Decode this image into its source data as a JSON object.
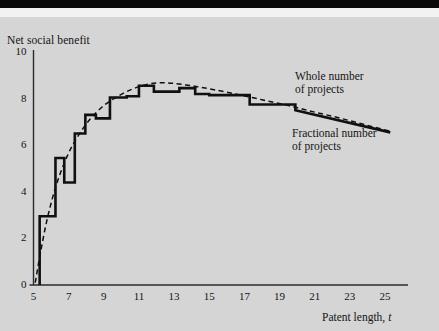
{
  "figure": {
    "background_color": "#d5d5d5",
    "top_bar_color": "#0a0a0a",
    "line_color": "#101010",
    "axis_color": "#2b2b2b"
  },
  "axes": {
    "y_title": "Net social benefit",
    "x_title_prefix": "Patent length, ",
    "x_title_symbol": "t",
    "y_ticks": [
      "0",
      "2",
      "4",
      "6",
      "8",
      "10"
    ],
    "x_ticks": [
      "5",
      "7",
      "9",
      "11",
      "13",
      "15",
      "17",
      "19",
      "21",
      "23",
      "25"
    ]
  },
  "annotations": [
    {
      "name": "whole-number-label",
      "line1": "Whole number",
      "line2": "of projects"
    },
    {
      "name": "fractional-number-label",
      "line1": "Fractional number",
      "line2": "of projects"
    }
  ],
  "chart_data": {
    "type": "line",
    "title": "",
    "xlabel": "Patent length, t",
    "ylabel": "Net social benefit",
    "xlim": [
      5,
      26
    ],
    "ylim": [
      0,
      10
    ],
    "grid": false,
    "legend_position": "inline-annotations",
    "y_ticks": [
      0,
      2,
      4,
      6,
      8,
      10
    ],
    "x_ticks": [
      5,
      7,
      9,
      11,
      13,
      15,
      17,
      19,
      21,
      23,
      25
    ],
    "series": [
      {
        "name": "Whole number of projects",
        "style": "solid-step",
        "x": [
          5.35,
          5.35,
          6.25,
          6.25,
          6.75,
          6.75,
          7.35,
          7.35,
          7.95,
          7.95,
          8.55,
          8.55,
          9.35,
          9.35,
          10.3,
          10.3,
          11.0,
          11.0,
          11.85,
          11.85,
          13.3,
          13.3,
          14.2,
          14.2,
          15.0,
          15.0,
          17.3,
          17.3,
          19.9,
          19.9,
          25.3
        ],
        "y": [
          0.0,
          2.95,
          2.95,
          5.45,
          5.45,
          4.4,
          4.4,
          6.5,
          6.5,
          7.3,
          7.3,
          7.15,
          7.15,
          8.05,
          8.05,
          8.1,
          8.1,
          8.55,
          8.55,
          8.3,
          8.3,
          8.45,
          8.45,
          8.2,
          8.2,
          8.15,
          8.15,
          7.75,
          7.75,
          7.5,
          6.55
        ],
        "comment": "staircase; rises from ~2.95 to peak ~8.55 near t=12, then steps down to ~6.55 at t=25"
      },
      {
        "name": "Fractional number of projects",
        "style": "dashed-smooth",
        "x": [
          5.1,
          5.4,
          5.8,
          6.3,
          6.9,
          7.5,
          8.2,
          9.0,
          9.8,
          10.6,
          11.4,
          12.2,
          13.0,
          14.0,
          15.0,
          16.5,
          18.0,
          19.5,
          21.0,
          22.5,
          24.0,
          25.3
        ],
        "y": [
          0.1,
          1.4,
          2.9,
          4.3,
          5.5,
          6.35,
          7.1,
          7.7,
          8.1,
          8.4,
          8.6,
          8.68,
          8.65,
          8.55,
          8.42,
          8.2,
          7.95,
          7.7,
          7.42,
          7.15,
          6.85,
          6.6
        ],
        "comment": "smooth concave envelope peaking ~8.68 at t≈12.2, declining to ~6.6"
      }
    ]
  }
}
